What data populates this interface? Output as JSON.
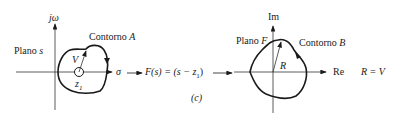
{
  "figure": {
    "panel_label": "(c)",
    "left_plot": {
      "vertical_axis": "jω",
      "horizontal_axis": "σ",
      "plane_label_prefix": "Plano",
      "plane_label_var": "s",
      "contour_label_prefix": "Contorno",
      "contour_label_var": "A",
      "vector_label": "V",
      "zero_label": "z",
      "zero_subscript": "1"
    },
    "mapping": {
      "text": "F(s) = (s − z",
      "subscript": "1",
      "close": ")"
    },
    "right_plot": {
      "vertical_axis": "Im",
      "horizontal_axis": "Re",
      "plane_label_prefix": "Plano",
      "plane_label_var": "F",
      "contour_label_prefix": "Contorno",
      "contour_label_var": "B",
      "vector_label": "R"
    },
    "relation": "R = V",
    "colors": {
      "line": "#1a1a1a",
      "thin": "#333333"
    }
  }
}
